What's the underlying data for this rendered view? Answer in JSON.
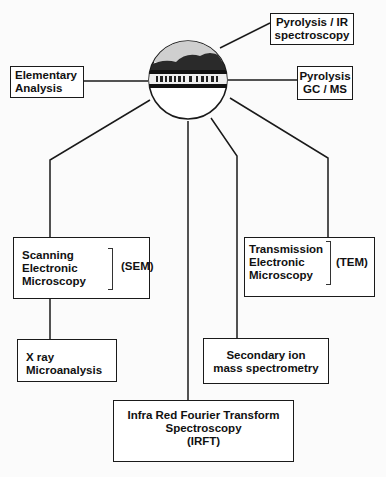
{
  "diagram": {
    "center_node": {
      "label": "sample image (landscape logo)"
    },
    "nodes": {
      "pyrolysis_ir": {
        "line1": "Pyrolysis / IR",
        "line2": "spectroscopy"
      },
      "elementary": {
        "line1": "Elementary",
        "line2": "Analysis"
      },
      "pyrolysis_gcms": {
        "line1": "Pyrolysis",
        "line2": "GC / MS"
      },
      "sem": {
        "line1": "Scanning",
        "line2": "Electronic",
        "line3": "Microscopy",
        "abbr": "(SEM)"
      },
      "tem": {
        "line1": "Transmission",
        "line2": "Electronic",
        "line3": "Microscopy",
        "abbr": "(TEM)"
      },
      "xray": {
        "line1": "X ray",
        "line2": "Microanalysis"
      },
      "sims": {
        "line1": "Secondary ion",
        "line2": "mass spectrometry"
      },
      "irft": {
        "line1": "Infra Red Fourier Transform",
        "line2": "Spectroscopy",
        "line3": "(IRFT)"
      }
    },
    "colors": {
      "line": "#1a1a1a",
      "background": "#fbfbfb"
    }
  }
}
